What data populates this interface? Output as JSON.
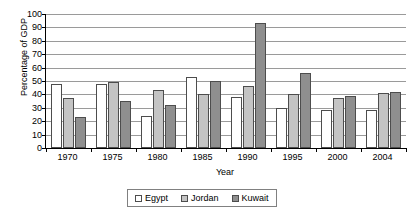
{
  "chart_data": {
    "type": "bar",
    "title": "",
    "xlabel": "Year",
    "ylabel": "Percentage of GDP",
    "categories": [
      "1970",
      "1975",
      "1980",
      "1985",
      "1990",
      "1995",
      "2000",
      "2004"
    ],
    "ylim": [
      0,
      100
    ],
    "ytick_step": 10,
    "yticks": [
      0,
      10,
      20,
      30,
      40,
      50,
      60,
      70,
      80,
      90,
      100
    ],
    "ytick_labels": [
      "0",
      "10",
      "20",
      "30",
      "40",
      "50",
      "60",
      "70",
      "80",
      "90",
      "100"
    ],
    "grid": true,
    "legend_position": "bottom",
    "series": [
      {
        "name": "Egypt",
        "color": "#ffffff",
        "values": [
          48,
          48,
          24,
          53,
          38,
          30,
          28,
          28
        ]
      },
      {
        "name": "Jordan",
        "color": "#c4c4c4",
        "values": [
          37,
          49,
          43,
          40,
          46,
          40,
          37,
          41
        ]
      },
      {
        "name": "Kuwait",
        "color": "#8f8f8f",
        "values": [
          23,
          35,
          32,
          50,
          93,
          56,
          39,
          42
        ]
      }
    ]
  }
}
